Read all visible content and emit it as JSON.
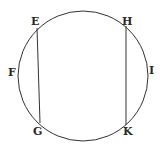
{
  "diagram": {
    "type": "circle-with-two-chords",
    "stroke_color": "#333333",
    "labels": {
      "E": "E",
      "H": "H",
      "F": "F",
      "I": "I",
      "G": "G",
      "K": "K"
    },
    "chords": [
      {
        "from": "E",
        "to": "G"
      },
      {
        "from": "H",
        "to": "K"
      }
    ]
  }
}
